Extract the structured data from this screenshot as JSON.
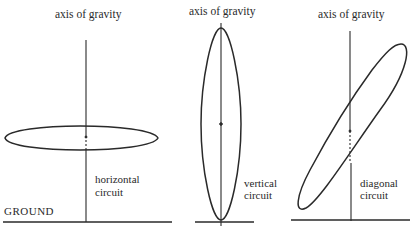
{
  "figure": {
    "panels": [
      {
        "id": "horizontal",
        "title": "axis of gravity",
        "label_line1": "horizontal",
        "label_line2": "circuit",
        "ground_label": "GROUND"
      },
      {
        "id": "vertical",
        "title": "axis of gravity",
        "label_line1": "vertical",
        "label_line2": "circuit"
      },
      {
        "id": "diagonal",
        "title": "axis of gravity",
        "label_line1": "diagonal",
        "label_line2": "circuit"
      }
    ],
    "stroke_color": "#2a2a2a",
    "background": "#ffffff"
  }
}
